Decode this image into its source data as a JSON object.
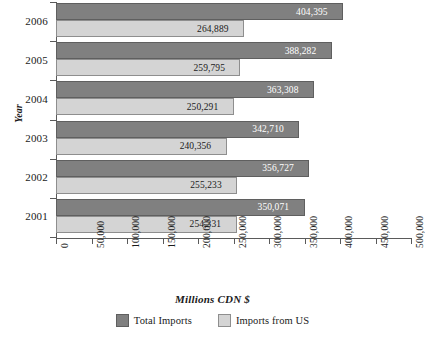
{
  "chart_data": {
    "type": "bar",
    "orientation": "horizontal",
    "title": "",
    "xlabel": "Millions CDN $",
    "ylabel": "Year",
    "categories": [
      "2006",
      "2005",
      "2004",
      "2003",
      "2002",
      "2001"
    ],
    "series": [
      {
        "name": "Total Imports",
        "color": "#808080",
        "values": [
          404395,
          388282,
          363308,
          342710,
          356727,
          350071
        ],
        "labels": [
          "404,395",
          "388,282",
          "363,308",
          "342,710",
          "356,727",
          "350,071"
        ]
      },
      {
        "name": "Imports from US",
        "color": "#d4d4d4",
        "values": [
          264889,
          259795,
          250291,
          240356,
          255233,
          254331
        ],
        "labels": [
          "264,889",
          "259,795",
          "250,291",
          "240,356",
          "255,233",
          "254,331"
        ]
      }
    ],
    "xlim": [
      0,
      500000
    ],
    "xticks": [
      0,
      50000,
      100000,
      150000,
      200000,
      250000,
      300000,
      350000,
      400000,
      450000,
      500000
    ],
    "xtick_labels": [
      "0",
      "50,000",
      "100,000",
      "150,000",
      "200,000",
      "250,000",
      "300,000",
      "350,000",
      "400,000",
      "450,000",
      "500,000"
    ],
    "grid": false,
    "legend_position": "bottom",
    "tick_label_rotation": -90
  },
  "axes": {
    "y_title": "Year",
    "x_title": "Millions CDN $"
  },
  "legend": {
    "items": [
      {
        "label": "Total Imports",
        "swatch": "#808080"
      },
      {
        "label": "Imports from US",
        "swatch": "#d4d4d4"
      }
    ]
  }
}
